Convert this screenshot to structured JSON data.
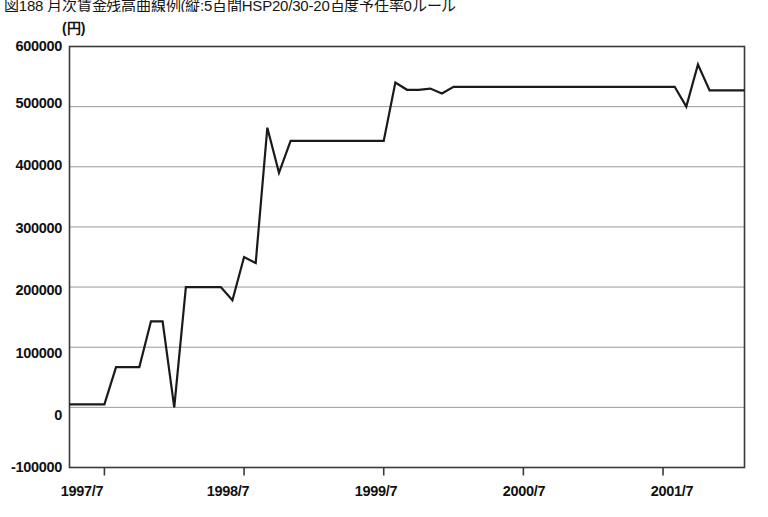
{
  "figure": {
    "title": "図188 月次賃金残高曲線例(縦:5百間HSP20/30-20百度予任率0ルール",
    "unit_label": "(円)"
  },
  "chart_data": {
    "type": "line",
    "title": "図188 月次賃金残高曲線例(縦:5百間HSP20/30-20百度予任率0ルール",
    "xlabel": "",
    "ylabel": "(円)",
    "ylim": [
      -100000,
      600000
    ],
    "yticks": [
      600000,
      500000,
      400000,
      300000,
      200000,
      100000,
      0,
      -100000
    ],
    "ytick_labels": [
      "600000",
      "500000",
      "400000",
      "300000",
      "200000",
      "100000",
      "0",
      "-100000"
    ],
    "xlim": [
      "1997/4",
      "2002/3"
    ],
    "xticks": [
      "1997/7",
      "1998/7",
      "1999/7",
      "2000/7",
      "2001/7"
    ],
    "grid": true,
    "legend": "none",
    "line_color": "#1a1a1a",
    "series": [
      {
        "name": "残高",
        "x": [
          "1997/4",
          "1997/5",
          "1997/6",
          "1997/7",
          "1997/8",
          "1997/9",
          "1997/10",
          "1997/11",
          "1997/12",
          "1998/1",
          "1998/2",
          "1998/3",
          "1998/4",
          "1998/5",
          "1998/6",
          "1998/7",
          "1998/8",
          "1998/9",
          "1998/10",
          "1998/11",
          "1998/12",
          "1999/1",
          "1999/2",
          "1999/3",
          "1999/4",
          "1999/5",
          "1999/6",
          "1999/7",
          "1999/8",
          "1999/9",
          "1999/10",
          "1999/11",
          "1999/12",
          "2000/1",
          "2000/2",
          "2000/3",
          "2000/4",
          "2000/5",
          "2000/6",
          "2000/7",
          "2000/8",
          "2000/9",
          "2000/10",
          "2000/11",
          "2000/12",
          "2001/1",
          "2001/2",
          "2001/3",
          "2001/4",
          "2001/5",
          "2001/6",
          "2001/7",
          "2001/8",
          "2001/9",
          "2001/10",
          "2001/11",
          "2001/12",
          "2002/1",
          "2002/2"
        ],
        "values": [
          5000,
          5000,
          5000,
          5000,
          67000,
          67000,
          67000,
          143000,
          143000,
          0,
          200000,
          200000,
          200000,
          200000,
          178000,
          250000,
          240000,
          465000,
          390000,
          443000,
          443000,
          443000,
          443000,
          443000,
          443000,
          443000,
          443000,
          443000,
          540000,
          528000,
          528000,
          530000,
          522000,
          533000,
          533000,
          533000,
          533000,
          533000,
          533000,
          533000,
          533000,
          533000,
          533000,
          533000,
          533000,
          533000,
          533000,
          533000,
          533000,
          533000,
          533000,
          533000,
          533000,
          500000,
          570000,
          527000,
          527000,
          527000,
          527000
        ]
      }
    ]
  },
  "axes": {
    "y_axis_name": "y-axis",
    "x_axis_name": "x-axis"
  }
}
